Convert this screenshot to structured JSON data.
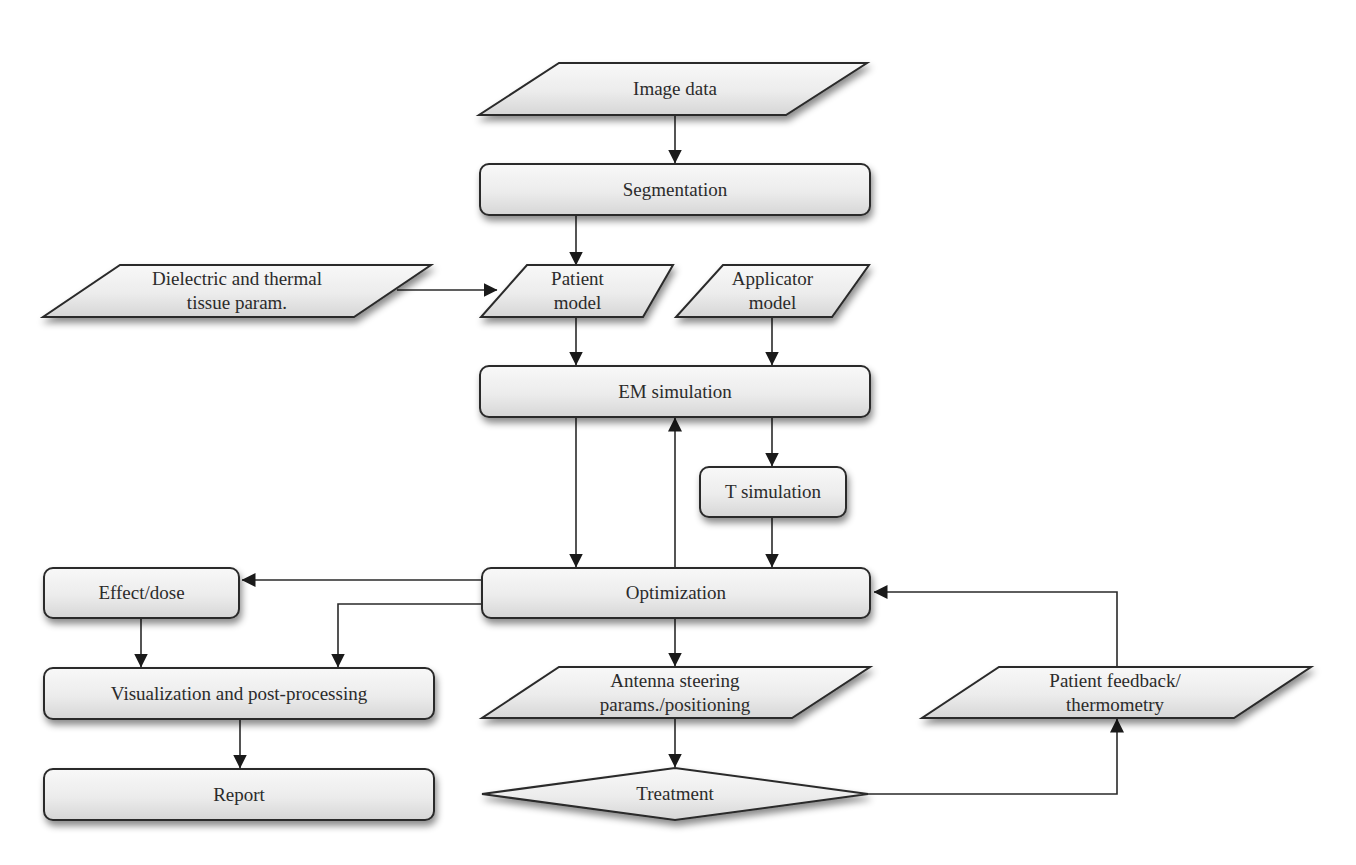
{
  "diagram": {
    "type": "flowchart",
    "colors": {
      "stroke": "#2a2a2a",
      "fill_top": "#f7f7f7",
      "fill_bottom": "#dcdcdc",
      "text": "#2b2b2b",
      "background": "#ffffff"
    },
    "nodes": {
      "image_data": {
        "label": "Image data",
        "shape": "parallelogram"
      },
      "segmentation": {
        "label": "Segmentation",
        "shape": "rounded-rect"
      },
      "dielectric": {
        "label": "Dielectric and thermal\ntissue param.",
        "shape": "parallelogram"
      },
      "patient_model": {
        "label": "Patient\nmodel",
        "shape": "parallelogram"
      },
      "applicator_model": {
        "label": "Applicator\nmodel",
        "shape": "parallelogram"
      },
      "em_simulation": {
        "label": "EM simulation",
        "shape": "rounded-rect"
      },
      "t_simulation": {
        "label": "T simulation",
        "shape": "rounded-rect"
      },
      "optimization": {
        "label": "Optimization",
        "shape": "rounded-rect"
      },
      "effect_dose": {
        "label": "Effect/dose",
        "shape": "rounded-rect"
      },
      "visualization": {
        "label": "Visualization and post-processing",
        "shape": "rounded-rect"
      },
      "report": {
        "label": "Report",
        "shape": "rounded-rect"
      },
      "antenna": {
        "label": "Antenna steering\nparams./positioning",
        "shape": "parallelogram"
      },
      "treatment": {
        "label": "Treatment",
        "shape": "diamond"
      },
      "feedback": {
        "label": "Patient feedback/\nthermometry",
        "shape": "parallelogram"
      }
    },
    "edges": [
      {
        "from": "Image data",
        "to": "Segmentation"
      },
      {
        "from": "Segmentation",
        "to": "Patient model"
      },
      {
        "from": "Dielectric and thermal tissue param.",
        "to": "Patient model"
      },
      {
        "from": "Patient model",
        "to": "EM simulation"
      },
      {
        "from": "Applicator model",
        "to": "EM simulation"
      },
      {
        "from": "EM simulation",
        "to": "Optimization"
      },
      {
        "from": "Optimization",
        "to": "EM simulation"
      },
      {
        "from": "EM simulation",
        "to": "T simulation"
      },
      {
        "from": "T simulation",
        "to": "Optimization"
      },
      {
        "from": "Optimization",
        "to": "Effect/dose"
      },
      {
        "from": "Optimization",
        "to": "Visualization and post-processing"
      },
      {
        "from": "Effect/dose",
        "to": "Visualization and post-processing"
      },
      {
        "from": "Visualization and post-processing",
        "to": "Report"
      },
      {
        "from": "Optimization",
        "to": "Antenna steering params./positioning"
      },
      {
        "from": "Antenna steering params./positioning",
        "to": "Treatment"
      },
      {
        "from": "Treatment",
        "to": "Patient feedback/thermometry"
      },
      {
        "from": "Patient feedback/thermometry",
        "to": "Optimization"
      }
    ]
  }
}
